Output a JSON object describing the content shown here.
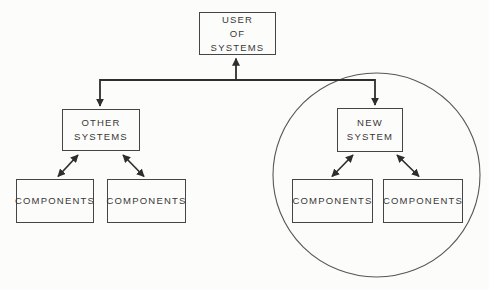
{
  "figure": {
    "type": "hierarchy-diagram",
    "colors": {
      "background": "#fcfcfb",
      "line": "#2e2e2e",
      "box_border": "#454545",
      "text": "#383838",
      "scope_circle": "#575757"
    },
    "nodes": {
      "user_of_systems": {
        "label": "USER\nOF\nSYSTEMS"
      },
      "other_systems": {
        "label": "OTHER\nSYSTEMS"
      },
      "components_left_a": {
        "label": "COMPONENTS"
      },
      "components_left_b": {
        "label": "COMPONENTS"
      },
      "new_system": {
        "label": "NEW\nSYSTEM"
      },
      "components_right_a": {
        "label": "COMPONENTS"
      },
      "components_right_b": {
        "label": "COMPONENTS"
      }
    },
    "edges": [
      {
        "from": "trunk",
        "to": "user_of_systems",
        "direction": "one-way-up"
      },
      {
        "from": "trunk",
        "to": "other_systems",
        "direction": "one-way-down"
      },
      {
        "from": "trunk",
        "to": "new_system",
        "direction": "one-way-down"
      },
      {
        "from": "other_systems",
        "to": "components_left_a",
        "direction": "two-way"
      },
      {
        "from": "other_systems",
        "to": "components_left_b",
        "direction": "two-way"
      },
      {
        "from": "new_system",
        "to": "components_right_a",
        "direction": "two-way"
      },
      {
        "from": "new_system",
        "to": "components_right_b",
        "direction": "two-way"
      }
    ],
    "scope_circle_encloses": [
      "new_system",
      "components_right_a",
      "components_right_b"
    ]
  }
}
